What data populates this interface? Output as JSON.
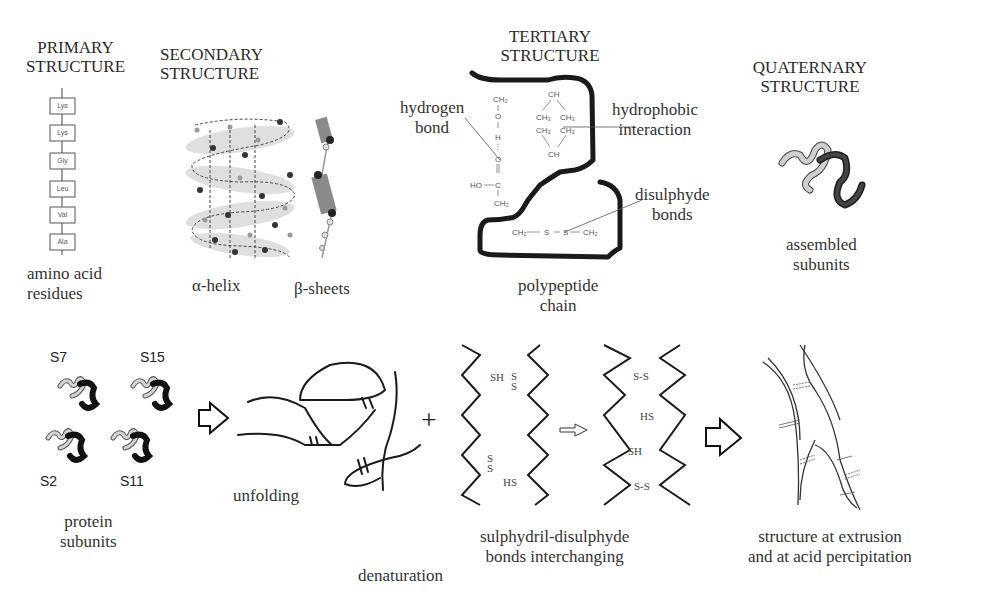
{
  "top_row": {
    "primary": {
      "title": "PRIMARY\nSTRUCTURE",
      "residues": [
        "Lys",
        "Lys",
        "Gly",
        "Leu",
        "Val",
        "Ala"
      ],
      "caption": "amino acid\nresidues"
    },
    "secondary": {
      "title": "SECONDARY\nSTRUCTURE",
      "helix_caption": "α-helix",
      "sheet_caption": "β-sheets"
    },
    "tertiary": {
      "title": "TERTIARY\nSTRUCTURE",
      "labels": {
        "hydrogen_bond": "hydrogen\nbond",
        "hydrophobic": "hydrophobic\ninteraction",
        "disulphyde": "disulphyde\nbonds",
        "chain": "polypeptide\nchain"
      },
      "chem": {
        "ch2_top": "CH₂",
        "o": "O",
        "h": "H",
        "o2": "O",
        "ho": "HO",
        "c": "C",
        "ch2_mid": "CH₂",
        "ch_top": "CH",
        "ch3_a": "CH₃",
        "ch3_b": "CH₃",
        "ch3_c": "CH₃",
        "ch3_d": "CH₃",
        "ch_bot": "CH",
        "ch2_s1": "CH₂",
        "s1": "S",
        "s2": "S",
        "ch2_s2": "CH₂"
      }
    },
    "quaternary": {
      "title": "QUATERNARY\nSTRUCTURE",
      "caption": "assembled\nsubunits"
    }
  },
  "bottom_row": {
    "subunits": {
      "labels": [
        "S7",
        "S15",
        "S2",
        "S11"
      ],
      "caption": "protein\nsubunits"
    },
    "unfolding_caption": "unfolding",
    "plus": "+",
    "denaturation_caption": "denaturation",
    "exchange": {
      "caption": "sulphydril-disulphyde\nbonds interchanging",
      "left_labels": {
        "sh": "SH",
        "ss_top": "S\nS",
        "ss_bot": "S\nS",
        "hs": "HS"
      },
      "right_labels": {
        "ss_top": "S-S",
        "hs": "HS",
        "sh": "SH",
        "ss_bot": "S-S"
      }
    },
    "final_caption": "structure at extrusion\nand at acid percipitation"
  }
}
